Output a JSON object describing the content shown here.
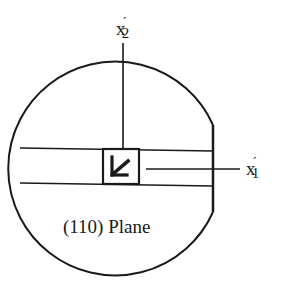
{
  "diagram": {
    "type": "crystal-wafer-orientation",
    "plane_label": "(110) Plane",
    "axes": {
      "x2": {
        "base": "x",
        "prime": "´",
        "sub": "2"
      },
      "x1": {
        "base": "x",
        "prime": "´",
        "sub": "1"
      }
    },
    "center_icon": "arrow-down-left-icon",
    "colors": {
      "stroke": "#1a1a1a",
      "background": "#ffffff"
    }
  }
}
